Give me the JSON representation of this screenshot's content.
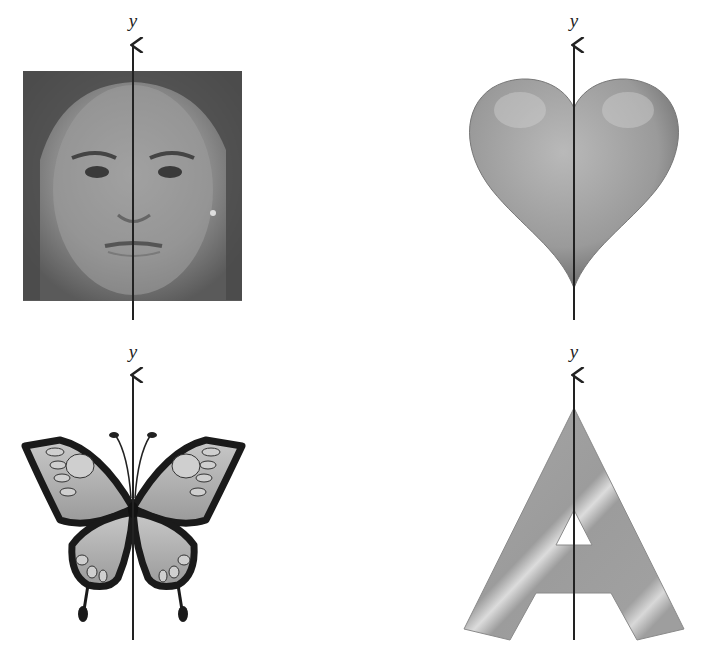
{
  "figure": {
    "axis_label": "y",
    "panels": [
      {
        "id": "face",
        "label": "y",
        "subject": "girl's face photograph"
      },
      {
        "id": "heart",
        "label": "y",
        "subject": "heart shape"
      },
      {
        "id": "butterfly",
        "label": "y",
        "subject": "butterfly"
      },
      {
        "id": "letter-a",
        "label": "y",
        "subject": "letter A",
        "glyph": "A"
      }
    ]
  },
  "colors": {
    "axis": "#222222",
    "background": "#ffffff"
  }
}
